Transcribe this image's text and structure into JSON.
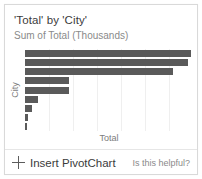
{
  "card": {
    "title": "'Total' by 'City'",
    "subtitle": "Sum of Total (Thousands)"
  },
  "footer": {
    "insert_label": "Insert PivotChart",
    "plus_icon": "plus-icon",
    "helpful_label": "Is this helpful?"
  },
  "colors": {
    "bar": "#5a5a5a",
    "border": "#d9d9d9",
    "gridline": "#efefef",
    "title_text": "#3b3b3b",
    "muted_text": "#8a8a8a",
    "axis_text": "#7c7c7c",
    "background": "#ffffff"
  },
  "chart_data": {
    "type": "bar",
    "orientation": "horizontal",
    "title": "'Total' by 'City'",
    "subtitle": "Sum of Total (Thousands)",
    "xlabel": "Total",
    "ylabel": "City",
    "grid": true,
    "grid_axis": "x",
    "legend": false,
    "xlim": [
      0,
      100
    ],
    "tick_labels": [],
    "categories": [
      "City 1",
      "City 2",
      "City 3",
      "City 4",
      "City 5",
      "City 6",
      "City 7",
      "City 8",
      "City 9"
    ],
    "values": [
      99,
      97,
      88,
      26,
      26,
      8,
      4,
      2,
      1
    ],
    "bar_count": 9
  }
}
